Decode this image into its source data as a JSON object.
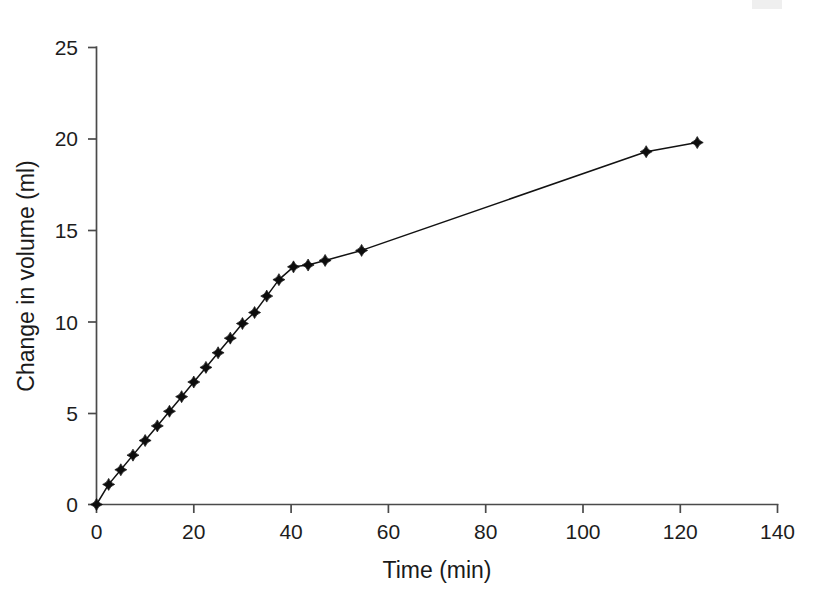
{
  "chart_data": {
    "type": "line",
    "title": "",
    "xlabel": "Time (min)",
    "ylabel": "Change in volume (ml)",
    "xlim": [
      0,
      140
    ],
    "ylim": [
      0,
      25
    ],
    "xticks": [
      0,
      20,
      40,
      60,
      80,
      100,
      120,
      140
    ],
    "yticks": [
      0,
      5,
      10,
      15,
      20,
      25
    ],
    "xtick_labels": [
      "0",
      "20",
      "40",
      "60",
      "80",
      "100",
      "120",
      "140"
    ],
    "ytick_labels": [
      "0",
      "5",
      "10",
      "15",
      "20",
      "25"
    ],
    "grid": false,
    "legend": null,
    "marker": "diamond",
    "line_color": "#121212",
    "marker_color": "#0d0d0d",
    "series": [
      {
        "name": "Change in volume",
        "x": [
          0,
          2.5,
          5,
          7.5,
          10,
          12.5,
          15,
          17.5,
          20,
          22.5,
          25,
          27.5,
          30,
          32.5,
          35,
          37.5,
          40.5,
          43.5,
          47,
          54.5,
          113,
          123.5
        ],
        "y": [
          0,
          1.1,
          1.9,
          2.7,
          3.5,
          4.3,
          5.1,
          5.9,
          6.7,
          7.5,
          8.3,
          9.1,
          9.9,
          10.5,
          11.4,
          12.3,
          13.0,
          13.1,
          13.35,
          13.9,
          19.3,
          19.8
        ]
      }
    ]
  },
  "axes": {
    "x_axis_name": "Time (min)",
    "y_axis_name": "Change in volume (ml)"
  }
}
